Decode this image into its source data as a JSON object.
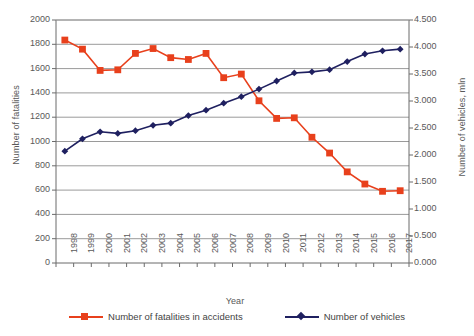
{
  "chart_data": {
    "type": "line",
    "title": "",
    "xlabel": "Year",
    "ylabel": "Number of fatalities",
    "ylabel_secondary": "Number of vehicles, mln",
    "grid": true,
    "legend_position": "bottom",
    "categories": [
      "1998",
      "1999",
      "2000",
      "2001",
      "2002",
      "2003",
      "2004",
      "2005",
      "2006",
      "2007",
      "2008",
      "2009",
      "2010",
      "2011",
      "2012",
      "2013",
      "2014",
      "2015",
      "2016",
      "2017"
    ],
    "yticks_left": [
      "0",
      "200",
      "400",
      "600",
      "800",
      "1000",
      "1200",
      "1400",
      "1600",
      "1800",
      "2000"
    ],
    "yticks_right": [
      "0.000",
      "0.500",
      "1.000",
      "1.500",
      "2.000",
      "2.500",
      "3.000",
      "3.500",
      "4.000",
      "4.500"
    ],
    "ylim_left": [
      0,
      2000
    ],
    "ylim_right": [
      0.0,
      4.5
    ],
    "series": [
      {
        "name": "Number of fatalities in accidents",
        "axis": "left",
        "color": "#E8401C",
        "marker": "square",
        "values": [
          1835,
          1760,
          1585,
          1590,
          1725,
          1765,
          1690,
          1675,
          1725,
          1525,
          1555,
          1335,
          1190,
          1195,
          1035,
          905,
          750,
          650,
          590,
          595
        ]
      },
      {
        "name": "Number of vehicles",
        "axis": "right",
        "color": "#1F2060",
        "marker": "diamond",
        "values": [
          2.07,
          2.3,
          2.43,
          2.4,
          2.45,
          2.55,
          2.59,
          2.73,
          2.83,
          2.96,
          3.08,
          3.22,
          3.37,
          3.52,
          3.54,
          3.58,
          3.73,
          3.87,
          3.93,
          3.96
        ]
      }
    ]
  },
  "legend": {
    "items": [
      {
        "label": "Number of fatalities in accidents"
      },
      {
        "label": "Number of vehicles"
      }
    ]
  }
}
